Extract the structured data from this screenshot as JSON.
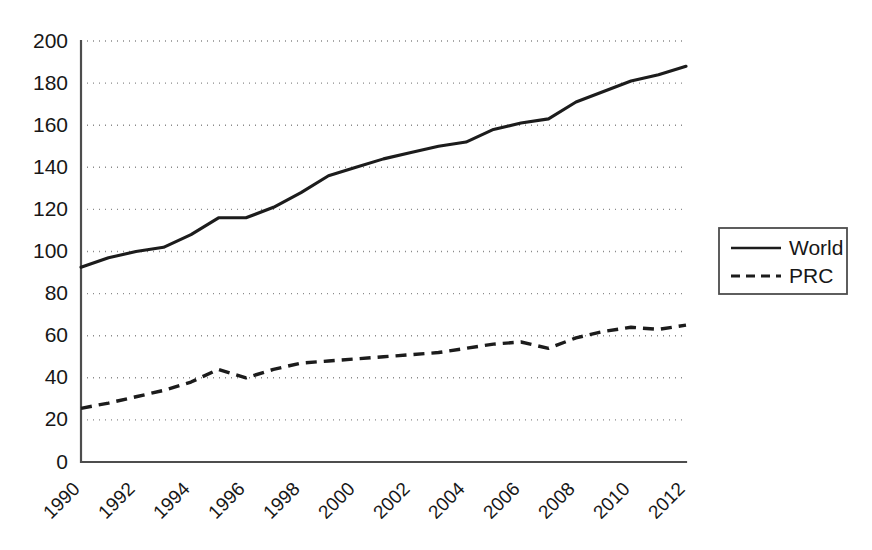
{
  "chart_data": {
    "type": "line",
    "title": "",
    "subtitle": "",
    "xlabel": "",
    "ylabel": "",
    "x": [
      1990,
      1991,
      1992,
      1993,
      1994,
      1995,
      1996,
      1997,
      1998,
      1999,
      2000,
      2001,
      2002,
      2003,
      2004,
      2005,
      2006,
      2007,
      2008,
      2009,
      2010,
      2011,
      2012
    ],
    "xlim": [
      1990,
      2012
    ],
    "ylim": [
      0,
      200
    ],
    "y_ticks": [
      0,
      20,
      40,
      60,
      80,
      100,
      120,
      140,
      160,
      180,
      200
    ],
    "x_ticks": [
      1990,
      1992,
      1994,
      1996,
      1998,
      2000,
      2002,
      2004,
      2006,
      2008,
      2010,
      2012
    ],
    "x_tick_labels": [
      "1990",
      "1992",
      "1994",
      "1996",
      "1998",
      "2000",
      "2002",
      "2004",
      "2006",
      "2008",
      "2010",
      "2012"
    ],
    "y_tick_labels": [
      "0",
      "20",
      "40",
      "60",
      "80",
      "100",
      "120",
      "140",
      "160",
      "180",
      "200"
    ],
    "x_tick_rotation": 45,
    "grid": "horizontal-dotted",
    "legend_position": "right",
    "series": [
      {
        "name": "World",
        "style": "solid",
        "color": "#1c1c1c",
        "values": [
          92.5,
          97,
          100,
          102,
          108,
          116,
          116,
          121,
          128,
          136,
          140,
          144,
          147,
          150,
          152,
          158,
          161,
          163,
          171,
          176,
          181,
          184,
          188
        ]
      },
      {
        "name": "PRC",
        "style": "dashed",
        "color": "#1c1c1c",
        "values": [
          25.5,
          28,
          31,
          34,
          38,
          44,
          40,
          44,
          47,
          48,
          49,
          50,
          51,
          52,
          54,
          56,
          57,
          54,
          59,
          62,
          64,
          63,
          65
        ]
      }
    ]
  },
  "legend": {
    "entries": [
      {
        "label": "World",
        "style": "solid"
      },
      {
        "label": "PRC",
        "style": "dashed"
      }
    ]
  },
  "colors": {
    "line": "#1c1c1c",
    "axis": "#4d4d4d",
    "grid": "#8a8a8a",
    "background": "#ffffff",
    "text": "#171717"
  }
}
